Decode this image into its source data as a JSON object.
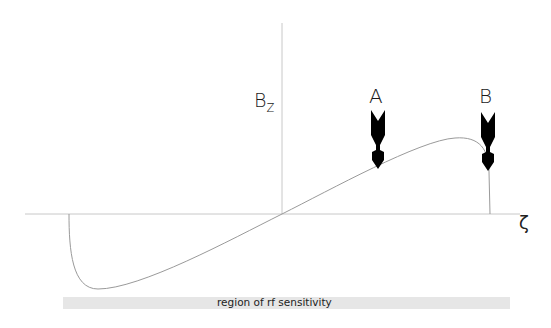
{
  "diagram": {
    "title": "",
    "y_axis": {
      "label": "B",
      "subscript": "z"
    },
    "x_axis": {
      "label": "ζ"
    },
    "markers": [
      {
        "id": "A",
        "label": "A",
        "x": 378
      },
      {
        "id": "B",
        "label": "B",
        "x": 488
      }
    ],
    "region": {
      "label": "region of rf sensitivity"
    },
    "colors": {
      "axis": "#c8c8c8",
      "curve": "#9a9a9a",
      "arrow": "#000000",
      "region_bar": "#e6e6e6"
    }
  }
}
